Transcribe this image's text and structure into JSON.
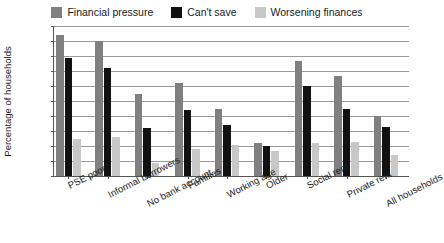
{
  "chart_data": {
    "type": "bar",
    "title": "",
    "subtitle": "",
    "xlabel": "",
    "ylabel": "Percentage of households",
    "ylim": [
      0,
      100
    ],
    "yticks": [
      0,
      10,
      20,
      30,
      40,
      50,
      60,
      70,
      80,
      90,
      100
    ],
    "grid": true,
    "legend_position": "top-center",
    "categories": [
      "PSE poor",
      "Informal borrowers",
      "No bank account",
      "Families",
      "Working age",
      "Older",
      "Social rent",
      "Private rent",
      "All households"
    ],
    "series": [
      {
        "name": "Financial pressure",
        "color": "#808080",
        "values": [
          94,
          90,
          55,
          62,
          45,
          22,
          77,
          67,
          40
        ]
      },
      {
        "name": "Can't save",
        "color": "#111111",
        "values": [
          79,
          72,
          32,
          44,
          34,
          20,
          60,
          45,
          33
        ]
      },
      {
        "name": "Worsening finances",
        "color": "#c8c8c8",
        "values": [
          25,
          26,
          9,
          18,
          21,
          17,
          22,
          23,
          14
        ]
      }
    ]
  },
  "legend": {
    "items": [
      {
        "label": "Financial pressure",
        "color": "#808080"
      },
      {
        "label": "Can't save",
        "color": "#111111"
      },
      {
        "label": "Worsening finances",
        "color": "#c8c8c8"
      }
    ]
  },
  "axes": {
    "y_title": "Percentage of households",
    "y_tick_labels": [
      "100",
      "90",
      "80",
      "70",
      "60",
      "50",
      "40",
      "30",
      "20",
      "10",
      "0"
    ],
    "x_tick_labels": [
      "PSE poor",
      "Informal borrowers",
      "No bank account",
      "Families",
      "Working age",
      "Older",
      "Social rent",
      "Private rent",
      "All households"
    ]
  }
}
